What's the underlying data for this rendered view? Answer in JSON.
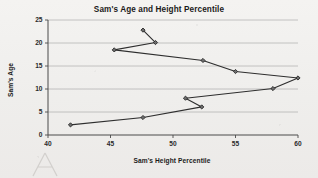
{
  "chart_data": {
    "type": "line",
    "title": "Sam's Age and Height Percentile",
    "xlabel": "Sam's Height Percentile",
    "ylabel": "Sam's Age",
    "xlim": [
      40,
      60
    ],
    "ylim": [
      0,
      25
    ],
    "xticks": [
      40,
      45,
      50,
      55,
      60
    ],
    "yticks": [
      0,
      5,
      10,
      15,
      20,
      25
    ],
    "grid": "horizontal",
    "legend": "none",
    "marker": "diamond",
    "line_color": "#2e2e2e",
    "marker_color": "#6e6e6e",
    "points": [
      {
        "x": 41.8,
        "y": 2.2
      },
      {
        "x": 47.6,
        "y": 3.8
      },
      {
        "x": 52.3,
        "y": 6.1
      },
      {
        "x": 51.0,
        "y": 8.0
      },
      {
        "x": 58.0,
        "y": 10.1
      },
      {
        "x": 60.0,
        "y": 12.4
      },
      {
        "x": 55.0,
        "y": 13.8
      },
      {
        "x": 52.4,
        "y": 16.2
      },
      {
        "x": 45.3,
        "y": 18.5
      },
      {
        "x": 48.6,
        "y": 20.1
      },
      {
        "x": 47.6,
        "y": 22.8
      }
    ],
    "series": [
      {
        "name": "Sam",
        "x": [
          41.8,
          47.6,
          52.3,
          51.0,
          58.0,
          60.0,
          55.0,
          52.4,
          45.3,
          48.6,
          47.6
        ],
        "values": [
          2.2,
          3.8,
          6.1,
          8.0,
          10.1,
          12.4,
          13.8,
          16.2,
          18.5,
          20.1,
          22.8
        ]
      }
    ]
  }
}
